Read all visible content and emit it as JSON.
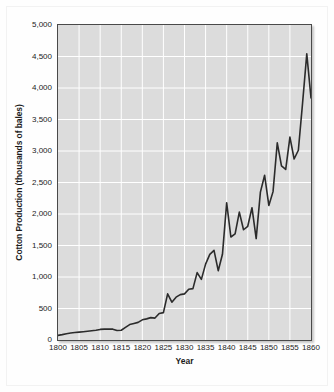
{
  "chart_data": {
    "type": "line",
    "title": "",
    "xlabel": "Year",
    "ylabel": "Cotton Production (thousands of bales)",
    "xlim": [
      1800,
      1860
    ],
    "ylim": [
      0,
      5000
    ],
    "grid": true,
    "legend": null,
    "y_ticks": [
      0,
      500,
      1000,
      1500,
      2000,
      2500,
      3000,
      3500,
      4000,
      4500,
      5000
    ],
    "y_tick_labels": [
      "0",
      "500",
      "1,000",
      "1,500",
      "2,000",
      "2,500",
      "3,000",
      "3,500",
      "4,000",
      "4,500",
      "5,000"
    ],
    "x_ticks": [
      1800,
      1805,
      1810,
      1815,
      1820,
      1825,
      1830,
      1835,
      1840,
      1845,
      1850,
      1855,
      1860
    ],
    "x_tick_labels": [
      "1800",
      "1805",
      "1810",
      "1815",
      "1820",
      "1825",
      "1830",
      "1835",
      "1840",
      "1845",
      "1850",
      "1855",
      "1860"
    ],
    "series": [
      {
        "name": "Cotton Production",
        "color": "#2b2b2b",
        "x": [
          1800,
          1801,
          1802,
          1803,
          1804,
          1805,
          1806,
          1807,
          1808,
          1809,
          1810,
          1811,
          1812,
          1813,
          1814,
          1815,
          1816,
          1817,
          1818,
          1819,
          1820,
          1821,
          1822,
          1823,
          1824,
          1825,
          1826,
          1827,
          1828,
          1829,
          1830,
          1831,
          1832,
          1833,
          1834,
          1835,
          1836,
          1837,
          1838,
          1839,
          1840,
          1841,
          1842,
          1843,
          1844,
          1845,
          1846,
          1847,
          1848,
          1849,
          1850,
          1851,
          1852,
          1853,
          1854,
          1855,
          1856,
          1857,
          1858,
          1859,
          1860
        ],
        "values": [
          73,
          85,
          100,
          110,
          118,
          125,
          132,
          140,
          148,
          155,
          168,
          172,
          175,
          172,
          150,
          155,
          200,
          245,
          262,
          280,
          320,
          335,
          355,
          348,
          420,
          435,
          732,
          600,
          680,
          720,
          732,
          805,
          816,
          1070,
          962,
          1205,
          1360,
          1423,
          1100,
          1360,
          2178,
          1635,
          1684,
          2030,
          1750,
          1805,
          2100,
          1610,
          2348,
          2615,
          2136,
          2355,
          3130,
          2765,
          2708,
          3221,
          2873,
          3012,
          3759,
          4541,
          3841
        ]
      }
    ],
    "annotations": []
  },
  "axes": {
    "y_title": "Cotton Production (thousands of bales)",
    "x_title": "Year"
  },
  "style": {
    "plot_background": "#dcdcdc",
    "grid_color": "#ffffff",
    "line_color": "#2b2b2b",
    "frame_color": "#4a4a4a",
    "page_background": "#fefefe",
    "text_color": "#1b1b1b"
  }
}
